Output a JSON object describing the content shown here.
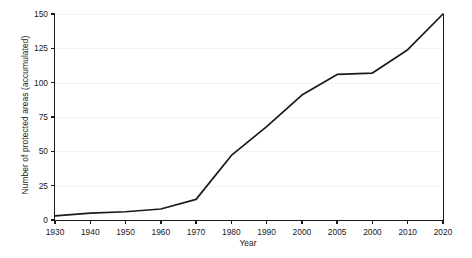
{
  "chart_data": {
    "type": "line",
    "title": "",
    "xlabel": "Year",
    "ylabel": "Number of protected areas (accumulated)",
    "x_tick_labels": [
      "1930",
      "1940",
      "1950",
      "1960",
      "1970",
      "1980",
      "1990",
      "2000",
      "2005",
      "2000",
      "2010",
      "2020"
    ],
    "categories": [
      "1930",
      "1940",
      "1950",
      "1960",
      "1970",
      "1980",
      "1990",
      "2000",
      "2005",
      "2000",
      "2010",
      "2020"
    ],
    "values": [
      3,
      5,
      6,
      8,
      15,
      47,
      68,
      91,
      106,
      107,
      124,
      150
    ],
    "y_tick_labels": [
      "0",
      "25",
      "50",
      "75",
      "100",
      "125",
      "150"
    ],
    "y_ticks": [
      0,
      25,
      50,
      75,
      100,
      125,
      150
    ],
    "ylim": [
      0,
      150
    ],
    "grid": true,
    "grid_axis": "y",
    "legend": "none",
    "line_color": "#1a1a1a",
    "grid_color": "#f2f2f2",
    "axis_color": "#1a1a1a",
    "background_color": "#ffffff"
  }
}
